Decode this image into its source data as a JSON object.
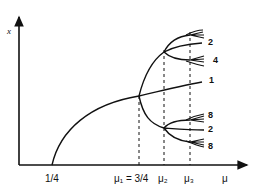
{
  "diagram": {
    "type": "bifurcation-diagram",
    "axes": {
      "y_label": "x",
      "x_label": "μ"
    },
    "x_ticks": [
      {
        "label": "1/4"
      },
      {
        "label": "μ₁ = 3/4"
      },
      {
        "label": "μ₂"
      },
      {
        "label": "μ₃"
      }
    ],
    "branch_labels": {
      "upper_period2": "2",
      "upper_period4": "4",
      "stable_fixed": "1",
      "lower_period8_top": "8",
      "lower_period2": "2",
      "lower_period8_bottom": "8"
    },
    "colors": {
      "ink": "#111111",
      "background": "#ffffff"
    }
  }
}
